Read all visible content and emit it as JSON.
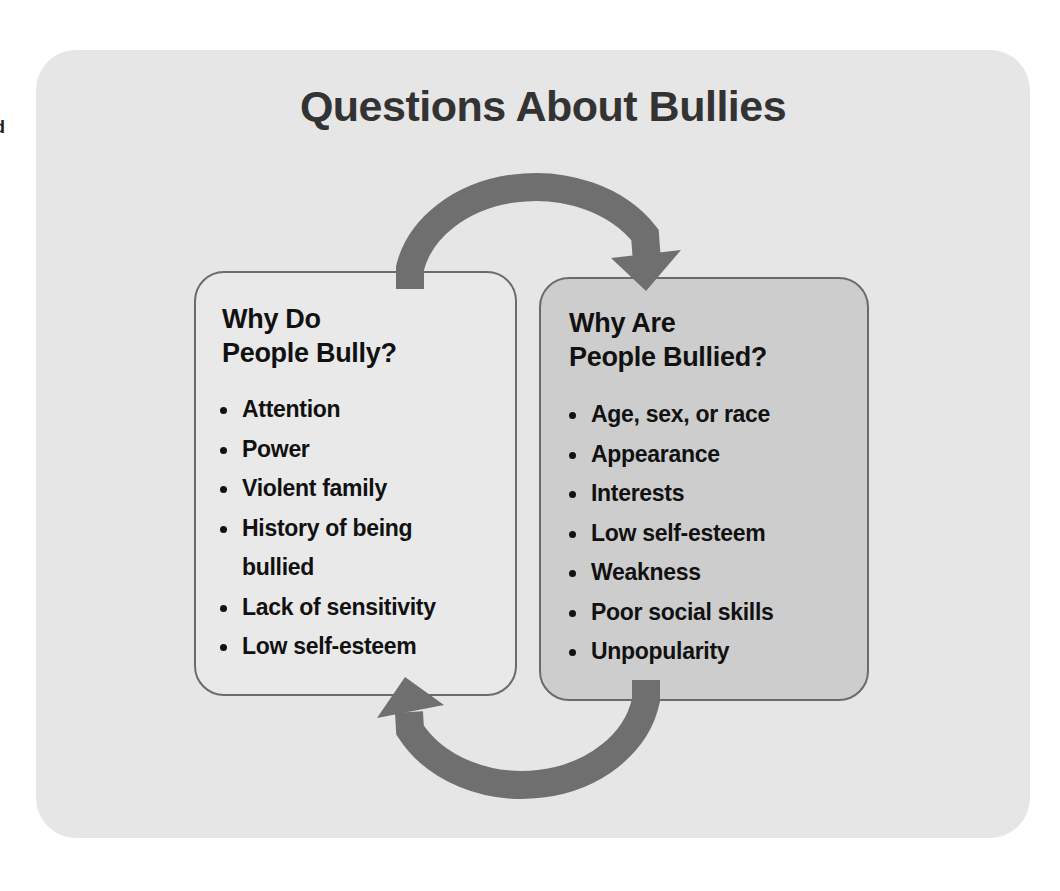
{
  "edge_fragments": [
    "d",
    "l"
  ],
  "title": "Questions About Bullies",
  "colors": {
    "panel_background": "#e6e6e6",
    "left_box_background": "#e9e9e9",
    "right_box_background": "#cdcdcd",
    "box_border": "#6b6b6b",
    "arrow": "#6f6f6f",
    "title_text": "#333333",
    "body_text": "#111111"
  },
  "left_box": {
    "heading_line1": "Why Do",
    "heading_line2": "People Bully?",
    "items": [
      {
        "line1": "Attention"
      },
      {
        "line1": "Power"
      },
      {
        "line1": "Violent family"
      },
      {
        "line1": "History of being",
        "line2": "bullied"
      },
      {
        "line1": "Lack of sensitivity"
      },
      {
        "line1": "Low self-esteem"
      }
    ]
  },
  "right_box": {
    "heading_line1": "Why Are",
    "heading_line2": "People Bullied?",
    "items": [
      {
        "line1": "Age, sex, or race"
      },
      {
        "line1": "Appearance"
      },
      {
        "line1": "Interests"
      },
      {
        "line1": "Low self-esteem"
      },
      {
        "line1": "Weakness"
      },
      {
        "line1": "Poor social skills"
      },
      {
        "line1": "Unpopularity"
      }
    ]
  },
  "arrows": [
    {
      "name": "top-arrow",
      "direction": "clockwise",
      "from": "left_box",
      "to": "right_box"
    },
    {
      "name": "bottom-arrow",
      "direction": "clockwise",
      "from": "right_box",
      "to": "left_box"
    }
  ]
}
